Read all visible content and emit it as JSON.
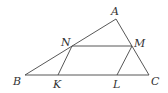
{
  "diagram": {
    "type": "geometry",
    "points": {
      "A": {
        "label": "A",
        "x": 116,
        "y": 19
      },
      "B": {
        "label": "B",
        "x": 25,
        "y": 75
      },
      "C": {
        "label": "C",
        "x": 149,
        "y": 75
      },
      "N": {
        "label": "N",
        "x": 72,
        "y": 46
      },
      "M": {
        "label": "M",
        "x": 132,
        "y": 46
      },
      "K": {
        "label": "K",
        "x": 58,
        "y": 75
      },
      "L": {
        "label": "L",
        "x": 117,
        "y": 75
      }
    },
    "segments": [
      "AB",
      "AC",
      "BC",
      "NM",
      "NK",
      "ML"
    ],
    "line_color": "#444444",
    "label_color": "#333333"
  }
}
